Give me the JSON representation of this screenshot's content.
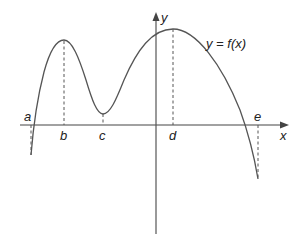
{
  "figure": {
    "type": "function-graph",
    "function_label": "y = f(x)",
    "axes": {
      "x_label": "x",
      "y_label": "y"
    },
    "points": [
      {
        "label": "a",
        "role": "left endpoint (below x-axis)"
      },
      {
        "label": "b",
        "role": "local maximum"
      },
      {
        "label": "c",
        "role": "local minimum"
      },
      {
        "label": "d",
        "role": "absolute maximum"
      },
      {
        "label": "e",
        "role": "right endpoint (below x-axis)"
      }
    ],
    "colors": {
      "curve": "#555555",
      "axes": "#444444",
      "dashed": "#555555",
      "background": "#ffffff"
    }
  }
}
